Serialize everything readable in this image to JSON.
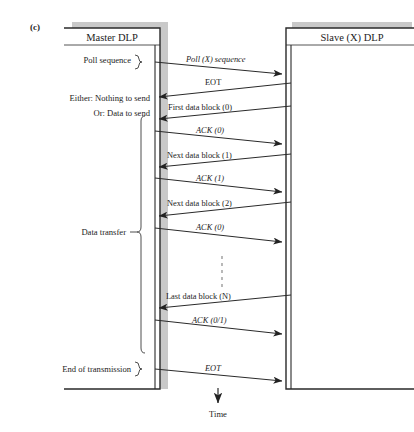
{
  "figure": {
    "part_label": "(c)",
    "time_axis_label": "Time"
  },
  "participants": [
    {
      "id": "master",
      "title": "Master DLP"
    },
    {
      "id": "slave",
      "title": "Slave (X) DLP"
    }
  ],
  "left_annotations": [
    {
      "id": "poll-sequence",
      "text": "Poll sequence",
      "brace": "small"
    },
    {
      "id": "either-nothing",
      "text": "Either: Nothing to send",
      "brace": "none"
    },
    {
      "id": "or-data-to-send",
      "text": "Or: Data to send",
      "brace": "none"
    },
    {
      "id": "data-transfer",
      "text": "Data transfer",
      "brace": "large"
    },
    {
      "id": "end-of-transmission",
      "text": "End of transmission",
      "brace": "small"
    }
  ],
  "messages": [
    {
      "id": "poll-x-sequence",
      "label": "Poll (X) sequence",
      "italic_part": "(X)",
      "direction": "master-to-slave"
    },
    {
      "id": "eot-1",
      "label": "EOT",
      "direction": "slave-to-master"
    },
    {
      "id": "first-data-block",
      "label": "First data block (0)",
      "direction": "slave-to-master"
    },
    {
      "id": "ack-0-a",
      "label": "ACK (0)",
      "direction": "master-to-slave"
    },
    {
      "id": "next-data-block-1",
      "label": "Next data block (1)",
      "direction": "slave-to-master"
    },
    {
      "id": "ack-1",
      "label": "ACK (1)",
      "direction": "master-to-slave"
    },
    {
      "id": "next-data-block-2",
      "label": "Next data block (2)",
      "direction": "slave-to-master"
    },
    {
      "id": "ack-0-b",
      "label": "ACK (0)",
      "direction": "master-to-slave"
    },
    {
      "id": "ellipsis",
      "label": "",
      "direction": "none"
    },
    {
      "id": "last-data-block-n",
      "label": "Last data block (N)",
      "direction": "slave-to-master"
    },
    {
      "id": "ack-0-1",
      "label": "ACK (0/1)",
      "direction": "master-to-slave"
    },
    {
      "id": "eot-2",
      "label": "EOT",
      "direction": "master-to-slave"
    }
  ],
  "colors": {
    "line": "#2a2a2a",
    "shadow": "#c9c9c9",
    "text": "#1c1c1c",
    "background": "#ffffff"
  }
}
